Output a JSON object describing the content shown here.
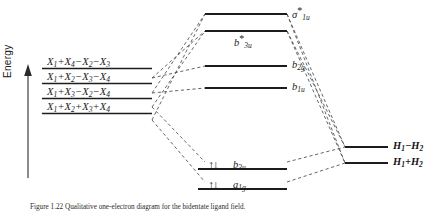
{
  "figure": {
    "axis": {
      "label": "Energy",
      "arrow": "up-arrow-icon"
    },
    "caption": "Figure 1.22  Qualitative one-electron diagram for the bidentate ligand field."
  },
  "left_column": {
    "name": "ligand-group-orbitals",
    "levels": [
      {
        "id": "lgo-4",
        "label_html": "X<sub>1</sub>+X<sub>4</sub>−X<sub>2</sub>−X<sub>3</sub>",
        "terms": [
          "X1",
          "+X4",
          "-X2",
          "-X3"
        ]
      },
      {
        "id": "lgo-3",
        "label_html": "X<sub>1</sub>+X<sub>2</sub>−X<sub>3</sub>−X<sub>4</sub>",
        "terms": [
          "X1",
          "+X2",
          "-X3",
          "-X4"
        ]
      },
      {
        "id": "lgo-2",
        "label_html": "X<sub>1</sub>+X<sub>3</sub>−X<sub>2</sub>−X<sub>4</sub>",
        "terms": [
          "X1",
          "+X3",
          "-X2",
          "-X4"
        ]
      },
      {
        "id": "lgo-1",
        "label_html": "X<sub>1</sub>+X<sub>2</sub>+X<sub>3</sub>+X<sub>4</sub>",
        "terms": [
          "X1",
          "+X2",
          "+X3",
          "+X4"
        ]
      }
    ]
  },
  "center_column": {
    "name": "molecular-orbitals",
    "levels": [
      {
        "id": "mo-sigma1u-star",
        "symbol": "σ",
        "subscript": "1u",
        "star": true,
        "occupancy": 0
      },
      {
        "id": "mo-b3u-star",
        "symbol": "b",
        "subscript": "3u",
        "star": true,
        "occupancy": 0
      },
      {
        "id": "mo-b2g",
        "symbol": "b",
        "subscript": "2g",
        "star": false,
        "occupancy": 0
      },
      {
        "id": "mo-b1u",
        "symbol": "b",
        "subscript": "1u",
        "star": false,
        "occupancy": 0
      },
      {
        "id": "mo-b3u",
        "symbol": "b",
        "subscript": "3u",
        "star": false,
        "occupancy": 2
      },
      {
        "id": "mo-a1g",
        "symbol": "a",
        "subscript": "1g",
        "star": false,
        "occupancy": 2
      }
    ],
    "electron_pair_glyph": "↑↓"
  },
  "right_column": {
    "name": "hydrogen-fragment-orbitals",
    "levels": [
      {
        "id": "h-minus",
        "label_html": "H<sub>1</sub>−H<sub>2</sub>"
      },
      {
        "id": "h-plus",
        "label_html": "H<sub>1</sub>+H<sub>2</sub>"
      }
    ]
  },
  "colors": {
    "level_line": "#1c1c1c",
    "correlation_line": "#3a3a3a",
    "text": "#1a1a1a"
  }
}
